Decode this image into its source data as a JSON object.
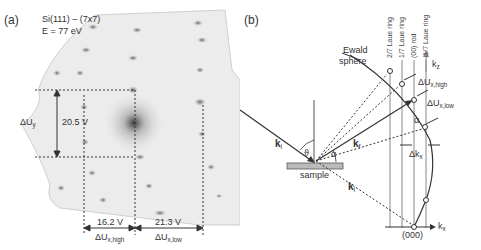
{
  "panel_a": {
    "label": "(a)",
    "title_line1": "Si(111) – (7x7)",
    "title_line2": "E = 77 eV",
    "delta_uy": {
      "symbol": "ΔU",
      "sub": "y",
      "value": "20.5 V"
    },
    "delta_ux_high": {
      "symbol": "ΔU",
      "sub": "x,high",
      "value": "16.2 V"
    },
    "delta_ux_low": {
      "symbol": "ΔU",
      "sub": "x,low",
      "value": "21.3 V"
    }
  },
  "panel_b": {
    "label": "(b)",
    "ewald_line1": "Ewald",
    "ewald_line2": "sphere",
    "rings": [
      "2/7 Laue ring",
      "1/7 Laue ring",
      "(00) rod",
      "-1/7 Laue ring"
    ],
    "kz": {
      "symbol": "k",
      "sub": "z"
    },
    "kx": {
      "symbol": "k",
      "sub": "x"
    },
    "dux_high": {
      "symbol": "ΔU",
      "sub": "x,high"
    },
    "dux_low": {
      "symbol": "ΔU",
      "sub": "x,low"
    },
    "alpha": "α",
    "theta": "ϑ",
    "dkx": {
      "symbol": "Δk",
      "sub": "x"
    },
    "ki": {
      "symbol": "k",
      "sub": "i"
    },
    "kf": {
      "symbol": "k",
      "sub": "f"
    },
    "ki2": {
      "symbol": "k",
      "sub": "i"
    },
    "sample": "sample",
    "origin": "(000)"
  }
}
